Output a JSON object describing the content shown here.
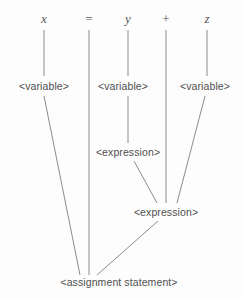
{
  "diagram": {
    "background_color": "#fdfdfd",
    "edge_color": "#8c8c8c",
    "text_color": "#4f4f4f",
    "width": 243,
    "height": 298,
    "tokens": [
      {
        "id": "tok-x",
        "label": "x",
        "kind": "identifier",
        "x": 44,
        "y": 18
      },
      {
        "id": "tok-eq",
        "label": "=",
        "kind": "operator",
        "x": 89,
        "y": 18
      },
      {
        "id": "tok-y",
        "label": "y",
        "kind": "identifier",
        "x": 128,
        "y": 18
      },
      {
        "id": "tok-plus",
        "label": "+",
        "kind": "operator",
        "x": 166,
        "y": 18
      },
      {
        "id": "tok-z",
        "label": "z",
        "kind": "identifier",
        "x": 207,
        "y": 18
      }
    ],
    "nonterminals": [
      {
        "id": "var-x",
        "label": "<variable>",
        "x": 44,
        "y": 86
      },
      {
        "id": "var-y",
        "label": "<variable>",
        "x": 123,
        "y": 86
      },
      {
        "id": "var-z",
        "label": "<variable>",
        "x": 205,
        "y": 86
      },
      {
        "id": "expr-upper",
        "label": "<expression>",
        "x": 128,
        "y": 152
      },
      {
        "id": "expr-lower",
        "label": "<expression>",
        "x": 166,
        "y": 212
      },
      {
        "id": "assign",
        "label": "<assignment statement>",
        "x": 119,
        "y": 282
      }
    ],
    "edges": [
      {
        "from": "tok-x",
        "to": "var-x",
        "x1": 44,
        "y1": 30,
        "x2": 44,
        "y2": 76
      },
      {
        "from": "tok-eq",
        "to": "assign",
        "x1": 89,
        "y1": 30,
        "x2": 89,
        "y2": 275
      },
      {
        "from": "tok-y",
        "to": "var-y",
        "x1": 128,
        "y1": 30,
        "x2": 128,
        "y2": 76
      },
      {
        "from": "tok-plus",
        "to": "expr-lower",
        "x1": 166,
        "y1": 30,
        "x2": 166,
        "y2": 203
      },
      {
        "from": "tok-z",
        "to": "var-z",
        "x1": 207,
        "y1": 30,
        "x2": 207,
        "y2": 76
      },
      {
        "from": "var-x",
        "to": "assign",
        "x1": 44,
        "y1": 96,
        "x2": 80,
        "y2": 275
      },
      {
        "from": "var-y",
        "to": "expr-upper",
        "x1": 128,
        "y1": 96,
        "x2": 128,
        "y2": 143
      },
      {
        "from": "var-z",
        "to": "expr-lower",
        "x1": 205,
        "y1": 96,
        "x2": 177,
        "y2": 203
      },
      {
        "from": "expr-upper",
        "to": "expr-lower",
        "x1": 134,
        "y1": 161,
        "x2": 157,
        "y2": 203
      },
      {
        "from": "expr-lower",
        "to": "assign",
        "x1": 158,
        "y1": 221,
        "x2": 97,
        "y2": 275
      }
    ]
  }
}
